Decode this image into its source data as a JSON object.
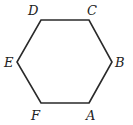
{
  "figure": {
    "type": "regular-hexagon",
    "stroke_color": "#2a2a2a",
    "background": "#ffffff",
    "vertices": [
      {
        "label": "A",
        "x": 89,
        "y": 103,
        "lx": 88,
        "ly": 120
      },
      {
        "label": "B",
        "x": 112,
        "y": 62,
        "lx": 114,
        "ly": 67
      },
      {
        "label": "C",
        "x": 89,
        "y": 20,
        "lx": 88,
        "ly": 15
      },
      {
        "label": "D",
        "x": 41,
        "y": 20,
        "lx": 29,
        "ly": 15
      },
      {
        "label": "E",
        "x": 17,
        "y": 62,
        "lx": 5,
        "ly": 67
      },
      {
        "label": "F",
        "x": 41,
        "y": 103,
        "lx": 31,
        "ly": 120
      }
    ]
  },
  "labels": {
    "A": "A",
    "B": "B",
    "C": "C",
    "D": "D",
    "E": "E",
    "F": "F"
  }
}
